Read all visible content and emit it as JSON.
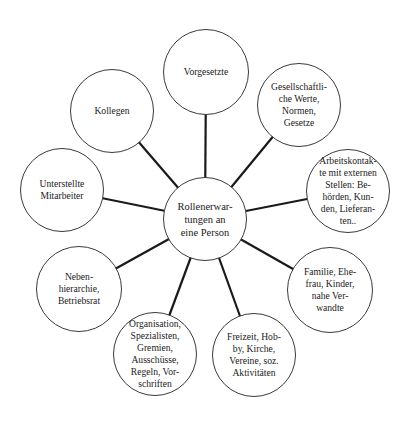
{
  "diagram": {
    "center": {
      "label": "Rollenerwar-\ntungen an\neine Person",
      "cx": 205,
      "cy": 219,
      "r": 42
    },
    "satellites": [
      {
        "id": "vorgesetzte",
        "label": "Vorgesetzte",
        "cx": 206,
        "cy": 72,
        "r": 43
      },
      {
        "id": "gesellschaftliche-werte",
        "label": "Gesellschaftli-\nche Werte,\nNormen,\nGesetze",
        "cx": 299,
        "cy": 105,
        "r": 42
      },
      {
        "id": "arbeitskontakte",
        "label": "Arbeitskontak-\nte mit externen\nStellen: Be-\nhörden, Kun-\nden, Lieferan-\nten..",
        "cx": 348,
        "cy": 191,
        "r": 42
      },
      {
        "id": "familie",
        "label": "Familie, Ehe-\nfrau, Kinder,\nnahe Ver-\nwandte",
        "cx": 330,
        "cy": 290,
        "r": 43
      },
      {
        "id": "freizeit",
        "label": "Freizeit, Hob-\nby, Kirche,\nVereine, soz.\nAktivitäten",
        "cx": 254,
        "cy": 355,
        "r": 42
      },
      {
        "id": "organisation",
        "label": "Organisation,\nSpezialisten,\nGremien,\nAusschüsse,\nRegeln, Vor-\nschriften",
        "cx": 155,
        "cy": 354,
        "r": 42
      },
      {
        "id": "nebenhierarchie",
        "label": "Neben-\nhierarchie,\nBetriebsrat",
        "cx": 79,
        "cy": 289,
        "r": 43
      },
      {
        "id": "unterstellte-mitarbeiter",
        "label": "Unterstellte\nMitarbeiter",
        "cx": 62,
        "cy": 190,
        "r": 42
      },
      {
        "id": "kollegen",
        "label": "Kollegen",
        "cx": 112,
        "cy": 111,
        "r": 42
      }
    ],
    "colors": {
      "connector": "#1a1a1a",
      "circle_border": "#3a3a3a",
      "text": "#222222",
      "background": "#ffffff"
    }
  }
}
